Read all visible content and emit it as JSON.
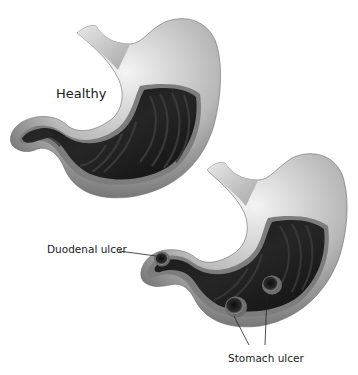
{
  "figure": {
    "colors": {
      "background": "#ffffff",
      "outer_wall_light": "#f2f2f2",
      "outer_wall_mid": "#9a9a9a",
      "outer_wall_dark": "#5a5a5a",
      "interior_lining": "#1c1c1c",
      "interior_fold": "#3a3a3a",
      "cut_edge": "#7d7d7d",
      "label_text": "#1a1a1a",
      "leader_line": "#222222"
    }
  },
  "labels": {
    "healthy": "Healthy",
    "duodenal_ulcer": "Duodenal ulcer",
    "stomach_ulcer": "Stomach ulcer"
  },
  "illustrations": [
    {
      "id": "healthy-stomach",
      "ulcers": 0
    },
    {
      "id": "ulcerated-stomach",
      "ulcers": 3,
      "ulcer_types": [
        "duodenal",
        "stomach",
        "stomach"
      ]
    }
  ]
}
